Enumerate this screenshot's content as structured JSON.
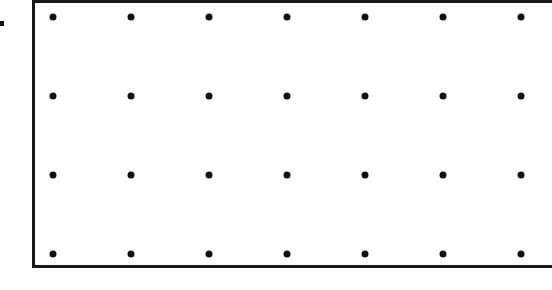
{
  "diagram": {
    "type": "dot-grid",
    "rows": 4,
    "columns": 7,
    "dot_x": [
      53,
      131,
      209,
      287,
      365,
      443,
      521
    ],
    "dot_y": [
      17,
      96,
      175,
      254
    ],
    "dot_color": "#111111",
    "border_color": "#1a1a1a"
  }
}
